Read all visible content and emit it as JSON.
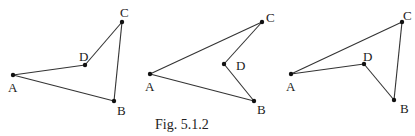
{
  "caption": "Fig. 5.1.2",
  "colors": {
    "stroke": "#333333",
    "point": "#111111",
    "text": "#222222",
    "background": "#ffffff"
  },
  "figures": [
    {
      "name": "quadrilateral-1",
      "points": {
        "A": {
          "x": 13,
          "y": 75,
          "label": "A",
          "lx": 8,
          "ly": 92
        },
        "D": {
          "x": 85,
          "y": 65,
          "label": "D",
          "lx": 79,
          "ly": 61
        },
        "C": {
          "x": 122,
          "y": 22,
          "label": "C",
          "lx": 120,
          "ly": 17
        },
        "B": {
          "x": 114,
          "y": 101,
          "label": "B",
          "lx": 117,
          "ly": 115
        }
      },
      "edges": [
        [
          "A",
          "D"
        ],
        [
          "D",
          "C"
        ],
        [
          "C",
          "B"
        ],
        [
          "B",
          "A"
        ]
      ]
    },
    {
      "name": "quadrilateral-2",
      "points": {
        "A": {
          "x": 150,
          "y": 74,
          "label": "A",
          "lx": 145,
          "ly": 91
        },
        "C": {
          "x": 262,
          "y": 22,
          "label": "C",
          "lx": 266,
          "ly": 22
        },
        "D": {
          "x": 224,
          "y": 64,
          "label": "D",
          "lx": 236,
          "ly": 70
        },
        "B": {
          "x": 254,
          "y": 101,
          "label": "B",
          "lx": 257,
          "ly": 114
        }
      },
      "edges": [
        [
          "A",
          "C"
        ],
        [
          "C",
          "D"
        ],
        [
          "D",
          "B"
        ],
        [
          "B",
          "A"
        ]
      ]
    },
    {
      "name": "quadrilateral-3",
      "points": {
        "A": {
          "x": 291,
          "y": 74,
          "label": "A",
          "lx": 286,
          "ly": 91
        },
        "C": {
          "x": 402,
          "y": 22,
          "label": "C",
          "lx": 403,
          "ly": 20
        },
        "D": {
          "x": 364,
          "y": 64,
          "label": "D",
          "lx": 363,
          "ly": 61
        },
        "B": {
          "x": 394,
          "y": 100,
          "label": "B",
          "lx": 400,
          "ly": 113
        }
      },
      "edges": [
        [
          "A",
          "C"
        ],
        [
          "C",
          "B"
        ],
        [
          "B",
          "D"
        ],
        [
          "D",
          "A"
        ]
      ]
    }
  ]
}
